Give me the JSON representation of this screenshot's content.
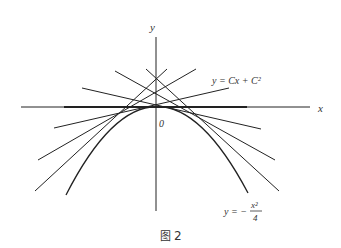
{
  "diagram": {
    "axis_x_label": "x",
    "axis_y_label": "y",
    "origin_label": "0",
    "line_family_label": "y = Cx + C²",
    "envelope_label_prefix": "y = −",
    "envelope_num": "x²",
    "envelope_den": "4",
    "caption_icon": "图",
    "caption_num": "2"
  }
}
